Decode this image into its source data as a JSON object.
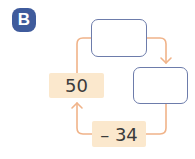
{
  "badge": {
    "label": "B",
    "color": "#3f5b9c"
  },
  "diagram": {
    "type": "number-cycle",
    "nodes": [
      {
        "id": "top",
        "value": "",
        "kind": "empty-box"
      },
      {
        "id": "right",
        "value": "",
        "kind": "empty-box"
      },
      {
        "id": "operation",
        "value": "– 34",
        "kind": "operation"
      },
      {
        "id": "start",
        "value": "50",
        "kind": "value"
      }
    ],
    "colors": {
      "arrow": "#f0b389",
      "box_border": "#6d7cab",
      "value_fill": "#fbe8cd"
    }
  }
}
